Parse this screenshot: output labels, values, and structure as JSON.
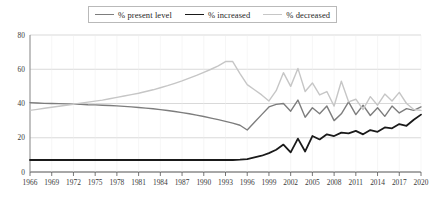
{
  "chart_data": {
    "type": "line",
    "title": "",
    "subtitle": "",
    "xlabel": "",
    "ylabel": "",
    "grid": true,
    "legend_position": "top-center",
    "xlim": [
      1966,
      2020
    ],
    "ylim": [
      0,
      80
    ],
    "yticks": [
      0,
      20,
      40,
      60,
      80
    ],
    "ytick_labels": [
      "0",
      "20",
      "40",
      "60",
      "80"
    ],
    "xticks": [
      1966,
      1969,
      1972,
      1975,
      1978,
      1981,
      1984,
      1987,
      1990,
      1993,
      1996,
      1999,
      2002,
      2005,
      2008,
      2011,
      2014,
      2017,
      2020
    ],
    "xtick_labels": [
      "1966",
      "1969",
      "1972",
      "1975",
      "1978",
      "1981",
      "1984",
      "1987",
      "1990",
      "1993",
      "1996",
      "1999",
      "2002",
      "2005",
      "2008",
      "2011",
      "2014",
      "2017",
      "2020"
    ],
    "x": [
      1966,
      1967,
      1968,
      1969,
      1970,
      1971,
      1972,
      1973,
      1974,
      1975,
      1976,
      1977,
      1978,
      1979,
      1980,
      1981,
      1982,
      1983,
      1984,
      1985,
      1986,
      1987,
      1988,
      1989,
      1990,
      1991,
      1992,
      1993,
      1994,
      1995,
      1996,
      1997,
      1998,
      1999,
      2000,
      2001,
      2002,
      2003,
      2004,
      2005,
      2006,
      2007,
      2008,
      2009,
      2010,
      2011,
      2012,
      2013,
      2014,
      2015,
      2016,
      2017,
      2018,
      2019,
      2020
    ],
    "series": [
      {
        "name": "% present level",
        "color": "#7d7d7d",
        "width": 1.4,
        "values": [
          40.5,
          40.3,
          40.1,
          40.0,
          39.9,
          39.8,
          39.6,
          39.5,
          39.3,
          39.2,
          39.0,
          38.8,
          38.6,
          38.3,
          38.0,
          37.7,
          37.3,
          36.9,
          36.4,
          35.9,
          35.3,
          34.7,
          34.0,
          33.2,
          32.4,
          31.5,
          30.6,
          29.6,
          28.5,
          27.3,
          24.5,
          29.0,
          33.5,
          38.0,
          39.5,
          40.0,
          35.5,
          42.0,
          32.0,
          37.5,
          34.0,
          38.5,
          30.0,
          34.0,
          41.0,
          33.5,
          39.0,
          33.0,
          37.5,
          32.5,
          38.5,
          34.5,
          37.0,
          36.0,
          38.0
        ]
      },
      {
        "name": "% increased",
        "color": "#1a1a1a",
        "width": 1.8,
        "values": [
          7.0,
          7.0,
          7.0,
          7.0,
          7.0,
          7.0,
          7.0,
          7.0,
          7.0,
          7.0,
          7.0,
          7.0,
          7.0,
          7.0,
          7.0,
          7.0,
          7.0,
          7.0,
          7.0,
          7.0,
          7.0,
          7.0,
          7.0,
          7.0,
          7.0,
          7.0,
          7.0,
          7.0,
          7.0,
          7.2,
          7.5,
          8.5,
          9.5,
          11.0,
          13.0,
          16.0,
          11.5,
          19.5,
          12.0,
          21.0,
          19.0,
          22.0,
          21.0,
          23.0,
          22.5,
          24.0,
          22.0,
          24.5,
          23.5,
          26.0,
          25.5,
          28.0,
          27.0,
          30.5,
          33.5
        ]
      },
      {
        "name": "% decreased",
        "color": "#c6c6c6",
        "width": 1.4,
        "values": [
          36.0,
          36.6,
          37.2,
          37.8,
          38.4,
          39.0,
          39.6,
          40.2,
          40.8,
          41.4,
          42.0,
          42.8,
          43.6,
          44.4,
          45.2,
          46.0,
          47.0,
          48.0,
          49.2,
          50.4,
          51.8,
          53.2,
          54.8,
          56.4,
          58.2,
          60.0,
          62.0,
          64.5,
          64.5,
          57.5,
          51.0,
          48.0,
          45.0,
          41.5,
          47.5,
          58.0,
          50.0,
          60.5,
          47.0,
          52.0,
          45.0,
          47.0,
          38.5,
          53.0,
          41.0,
          42.5,
          36.5,
          44.0,
          39.0,
          45.5,
          41.5,
          46.5,
          40.0,
          36.5,
          36.0
        ]
      }
    ],
    "legend": [
      {
        "label": "% present level",
        "color": "#7d7d7d",
        "width": 1.4
      },
      {
        "label": "% increased",
        "color": "#1a1a1a",
        "width": 1.8
      },
      {
        "label": "% decreased",
        "color": "#c6c6c6",
        "width": 1.4
      }
    ],
    "colors": {
      "axis": "#555555",
      "grid": "#c9c9c9",
      "text": "#2b2b2b",
      "background": "#ffffff"
    }
  }
}
